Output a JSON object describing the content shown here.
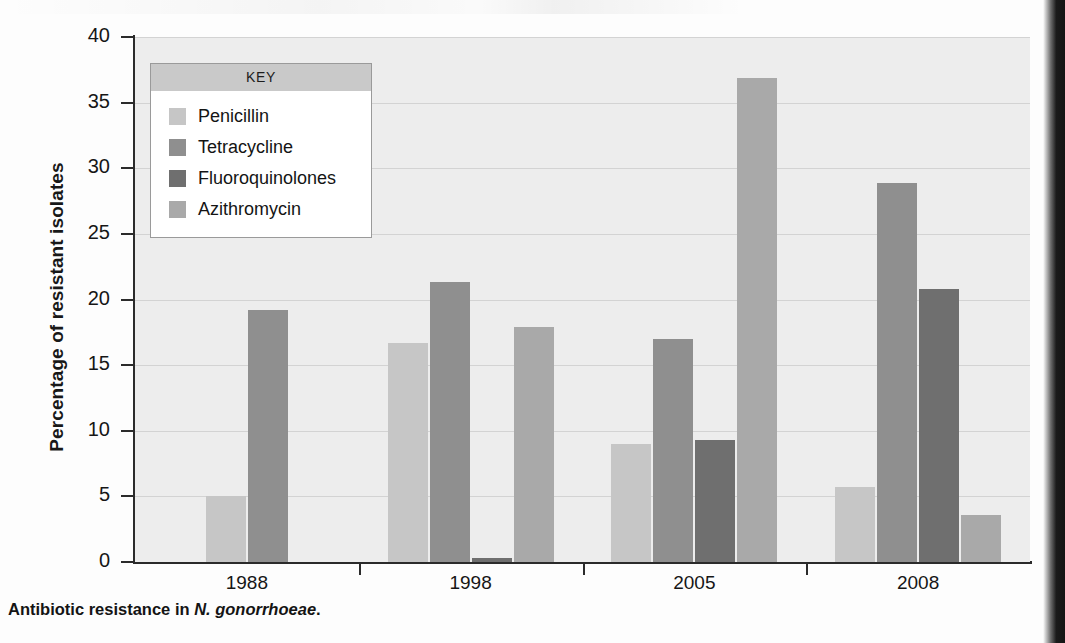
{
  "figure": {
    "caption_prefix": "Antibiotic resistance in ",
    "caption_species": "N. gonorrhoeae",
    "caption_suffix": "."
  },
  "legend": {
    "title": "KEY"
  },
  "colors": {
    "penicillin": "#c6c6c6",
    "tetracycline": "#8f8f8f",
    "fluoroquinolones": "#6f6f6f",
    "azithromycin": "#a9a9a9",
    "plot_background": "#ededed",
    "gridline": "#d3d3d3",
    "axis": "#2b2b2b",
    "legend_header": "#c9c9c9"
  },
  "chart_data": {
    "type": "bar",
    "title": "",
    "xlabel": "",
    "ylabel": "Percentage of resistant isolates",
    "ylim": [
      0,
      40
    ],
    "yticks": [
      0,
      5,
      10,
      15,
      20,
      25,
      30,
      35,
      40
    ],
    "grid": true,
    "legend_position": "inside-top-left",
    "categories": [
      "1988",
      "1998",
      "2005",
      "2008"
    ],
    "series": [
      {
        "name": "Penicillin",
        "values": [
          5.0,
          16.7,
          9.0,
          5.7
        ]
      },
      {
        "name": "Tetracycline",
        "values": [
          19.2,
          21.3,
          17.0,
          28.9
        ]
      },
      {
        "name": "Fluoroquinolones",
        "values": [
          null,
          0.3,
          9.3,
          20.8
        ]
      },
      {
        "name": "Azithromycin",
        "values": [
          null,
          17.9,
          36.9,
          3.6
        ]
      }
    ]
  }
}
